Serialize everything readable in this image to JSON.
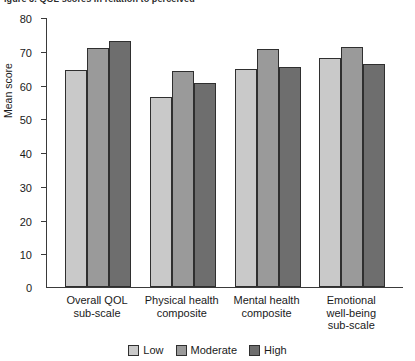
{
  "caption": {
    "clipped_text": "igure 3. QOL scores in relation to perceived"
  },
  "chart_data": {
    "type": "bar",
    "title": "",
    "xlabel": "",
    "ylabel": "Mean score",
    "ylim": [
      0,
      80
    ],
    "ytick_values": [
      0,
      10,
      20,
      30,
      40,
      50,
      60,
      70,
      80
    ],
    "ytick_labels": [
      "0",
      "10",
      "20",
      "30",
      "40",
      "50",
      "60",
      "70",
      "80"
    ],
    "grid": false,
    "legend_position": "bottom-center",
    "categories": [
      "Overall QOL\nsub-scale",
      "Physical health\ncomposite",
      "Mental health\ncomposite",
      "Emotional\nwell-being\nsub-scale"
    ],
    "category_lines": [
      [
        "Overall QOL",
        "sub-scale"
      ],
      [
        "Physical health",
        "composite"
      ],
      [
        "Mental health",
        "composite"
      ],
      [
        "Emotional",
        "well-being",
        "sub-scale"
      ]
    ],
    "series": [
      {
        "name": "Low",
        "color": "#c9c9c9",
        "values": [
          64.3,
          56.3,
          64.6,
          67.9
        ]
      },
      {
        "name": "Moderate",
        "color": "#9a9a9a",
        "values": [
          70.8,
          64.0,
          70.5,
          71.1
        ]
      },
      {
        "name": "High",
        "color": "#6e6e6e",
        "values": [
          72.9,
          60.4,
          65.2,
          66.1
        ]
      }
    ]
  },
  "legend": {
    "items": [
      {
        "label": "Low",
        "color": "#c9c9c9"
      },
      {
        "label": "Moderate",
        "color": "#9a9a9a"
      },
      {
        "label": "High",
        "color": "#6e6e6e"
      }
    ]
  },
  "axis": {
    "y_title": "Mean score"
  }
}
